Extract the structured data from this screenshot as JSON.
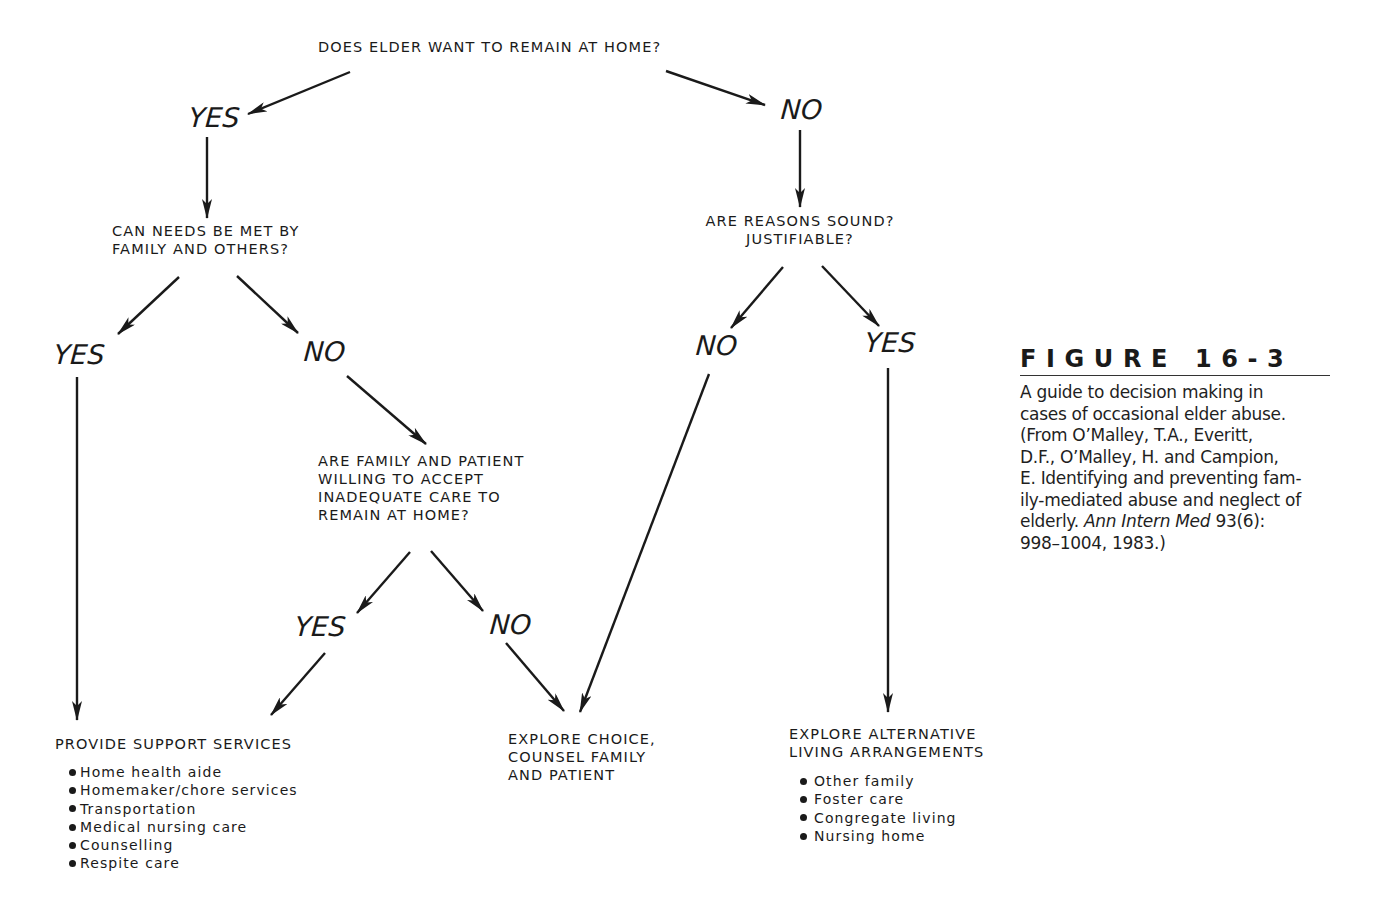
{
  "figure": {
    "label": "FIGURE 16-3",
    "caption_lines": [
      "A guide to decision making in",
      "cases of occasional elder abuse.",
      "(From O’Malley, T.A., Everitt,",
      "D.F., O’Malley, H. and Campion,",
      "E. Identifying and preventing fam-",
      "ily-mediated abuse and neglect of"
    ],
    "caption_line7_pre": "elderly. ",
    "caption_journal": "Ann Intern Med",
    "caption_line7_post": " 93(6):",
    "caption_line8": "998–1004, 1983.)"
  },
  "flowchart": {
    "root_question": "DOES ELDER WANT TO REMAIN AT HOME?",
    "root_yes": "YES",
    "root_no": "NO",
    "q_needs_met": "CAN NEEDS BE MET BY\nFAMILY AND OTHERS?",
    "needs_yes": "YES",
    "needs_no": "NO",
    "q_accept_inadequate": "ARE FAMILY AND PATIENT\nWILLING TO ACCEPT\nINADEQUATE CARE TO\nREMAIN AT HOME?",
    "accept_yes": "YES",
    "accept_no": "NO",
    "q_reasons_sound": "ARE REASONS SOUND?\nJUSTIFIABLE?",
    "reasons_no": "NO",
    "reasons_yes": "YES",
    "outcomes": {
      "support_services": {
        "title": "PROVIDE SUPPORT SERVICES",
        "items": [
          "Home health aide",
          "Homemaker/chore services",
          "Transportation",
          "Medical nursing care",
          "Counselling",
          "Respite care"
        ]
      },
      "explore_choice": {
        "title": "EXPLORE CHOICE,\nCOUNSEL FAMILY\nAND PATIENT"
      },
      "alternative_living": {
        "title": "EXPLORE ALTERNATIVE\nLIVING ARRANGEMENTS",
        "items": [
          "Other family",
          "Foster care",
          "Congregate living",
          "Nursing home"
        ]
      }
    }
  },
  "colors": {
    "ink": "#1a1a1a",
    "background": "#ffffff"
  }
}
